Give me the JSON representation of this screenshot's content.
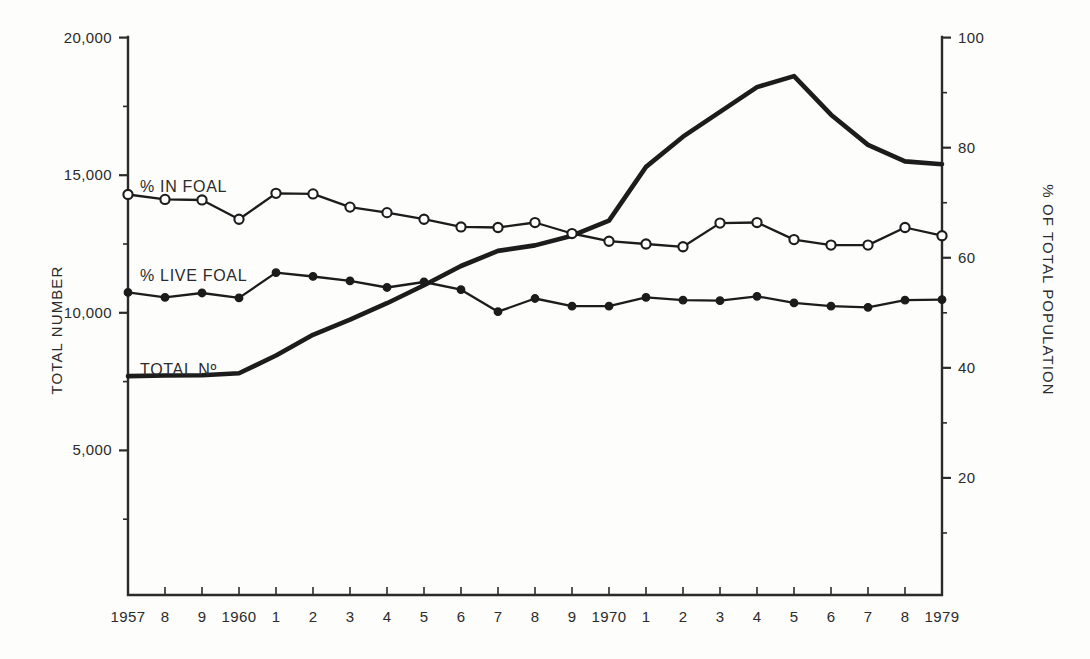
{
  "chart_data": {
    "type": "line",
    "title": "",
    "xlabel": "",
    "ylabel": "TOTAL NUMBER",
    "y2label": "% OF TOTAL POPULATION",
    "grid": false,
    "legend_position": "inline-left",
    "x": [
      1957,
      1958,
      1959,
      1960,
      1961,
      1962,
      1963,
      1964,
      1965,
      1966,
      1967,
      1968,
      1969,
      1970,
      1971,
      1972,
      1973,
      1974,
      1975,
      1976,
      1977,
      1978,
      1979
    ],
    "xtick_labels": [
      "1957",
      "8",
      "9",
      "1960",
      "1",
      "2",
      "3",
      "4",
      "5",
      "6",
      "7",
      "8",
      "9",
      "1970",
      "1",
      "2",
      "3",
      "4",
      "5",
      "6",
      "7",
      "8",
      "1979"
    ],
    "ylim": [
      0,
      20000
    ],
    "ytick_labels": [
      "20,000",
      "15,000",
      "10,000",
      "5,000"
    ],
    "ytick_values": [
      20000,
      15000,
      10000,
      5000
    ],
    "y2lim": [
      0,
      100
    ],
    "y2tick_labels": [
      "100",
      "80",
      "60",
      "40",
      "20"
    ],
    "y2tick_values": [
      100,
      80,
      60,
      40,
      20
    ],
    "series": [
      {
        "name": "TOTAL No",
        "axis": "left",
        "marker": "none",
        "values": [
          7700,
          7720,
          7730,
          7800,
          8450,
          9200,
          9750,
          10350,
          11000,
          11700,
          12250,
          12450,
          12800,
          13350,
          15300,
          16400,
          17300,
          18200,
          18600,
          17200,
          16100,
          15500,
          15400
        ]
      },
      {
        "name": "% IN FOAL",
        "axis": "right",
        "marker": "open-circle",
        "values": [
          71.5,
          70.6,
          70.5,
          67.0,
          71.7,
          71.6,
          69.2,
          68.2,
          67.0,
          65.6,
          65.5,
          66.4,
          64.4,
          63.0,
          62.5,
          62.0,
          66.3,
          66.4,
          63.3,
          62.3,
          62.3,
          65.5,
          64.0
        ]
      },
      {
        "name": "% LIVE FOAL",
        "axis": "right",
        "marker": "filled-circle",
        "values": [
          53.7,
          52.8,
          53.6,
          52.7,
          57.3,
          56.6,
          55.8,
          54.6,
          55.6,
          54.2,
          50.2,
          52.6,
          51.2,
          51.2,
          52.8,
          52.3,
          52.2,
          53.0,
          51.8,
          51.2,
          51.0,
          52.3,
          52.4
        ]
      }
    ]
  },
  "labels": {
    "series_in_foal": "% IN FOAL",
    "series_live_foal": "% LIVE FOAL",
    "series_total": "TOTAL Nº",
    "y_axis_title": "TOTAL NUMBER",
    "y2_axis_title": "% OF TOTAL POPULATION"
  },
  "colors": {
    "background": "#fdfdfc",
    "ink": "#1c1c1c",
    "axis": "#2b2b2b"
  }
}
